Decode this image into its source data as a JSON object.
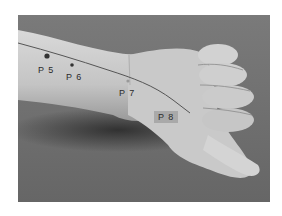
{
  "figure": {
    "background_color": "#6e6e6e",
    "skin_color": "#c8c8c8",
    "line_color": "#555555",
    "points": [
      {
        "id": "P5",
        "label": "P 5"
      },
      {
        "id": "P6",
        "label": "P 6"
      },
      {
        "id": "P7",
        "label": "P 7"
      },
      {
        "id": "P8",
        "label": "P 8"
      }
    ]
  }
}
